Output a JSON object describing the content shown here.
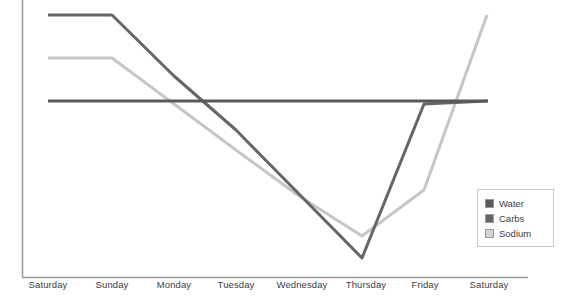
{
  "chart_data": {
    "type": "line",
    "title": "",
    "xlabel": "",
    "ylabel": "",
    "grid": false,
    "legend_position": "bottom-right",
    "categories": [
      "Saturday",
      "Sunday",
      "Monday",
      "Tuesday",
      "Wednesday",
      "Thursday",
      "Friday",
      "Saturday"
    ],
    "x_pixels": [
      48,
      112,
      174,
      236,
      299,
      362,
      424,
      487
    ],
    "y_axis_top_pixel": 0,
    "y_axis_bottom_pixel": 277,
    "series": [
      {
        "name": "Water",
        "color": "#595959",
        "values": [
          64,
          64,
          64,
          64,
          64,
          64,
          64,
          64
        ],
        "y_pixels": [
          101,
          101,
          101,
          101,
          101,
          101,
          101,
          101
        ],
        "line_start_pixel_x": 48,
        "line_end_pixel_x": 488
      },
      {
        "name": "Carbs",
        "color": "#666666",
        "values": [
          95,
          95,
          72,
          53,
          28,
          7,
          63,
          63
        ],
        "y_pixels": [
          15,
          15,
          76,
          130,
          194,
          258,
          104,
          101
        ]
      },
      {
        "name": "Sodium",
        "color": "#c6c6c6",
        "values": [
          79,
          79,
          62,
          46,
          30,
          15,
          32,
          95
        ],
        "y_pixels": [
          58,
          58,
          104,
          150,
          196,
          236,
          190,
          15
        ]
      }
    ],
    "axis_color": "#9a9a9a",
    "tick_text_color": "#3d3d3d"
  },
  "legend": {
    "entries": [
      {
        "label": "Water",
        "color": "#595959"
      },
      {
        "label": "Carbs",
        "color": "#666666"
      },
      {
        "label": "Sodium",
        "color": "#d3d3d3"
      }
    ]
  },
  "axis": {
    "tick_labels": [
      "Saturday",
      "Sunday",
      "Monday",
      "Tuesday",
      "Wednesday",
      "Thursday",
      "Friday",
      "Saturday"
    ],
    "tick_label_y": 284
  }
}
